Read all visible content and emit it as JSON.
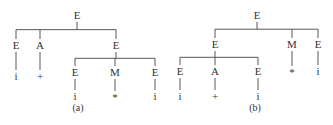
{
  "trees": [
    {
      "caption": "(a)",
      "caption_pos": [
        78,
        111
      ],
      "nodes": [
        {
          "id": "a_root",
          "label": "E",
          "x": 77,
          "y": 19
        },
        {
          "id": "a_E1",
          "label": "E",
          "x": 16,
          "y": 49
        },
        {
          "id": "a_A",
          "label": "A",
          "x": 40,
          "y": 49
        },
        {
          "id": "a_E2",
          "label": "E",
          "x": 116,
          "y": 49
        },
        {
          "id": "a_i1",
          "label": "i",
          "x": 16,
          "y": 80
        },
        {
          "id": "a_plus",
          "label": "+",
          "x": 40,
          "y": 80
        },
        {
          "id": "a_E3",
          "label": "E",
          "x": 75,
          "y": 76
        },
        {
          "id": "a_M",
          "label": "M",
          "x": 115,
          "y": 76
        },
        {
          "id": "a_E4",
          "label": "E",
          "x": 155,
          "y": 76
        },
        {
          "id": "a_i2",
          "label": "i",
          "x": 75,
          "y": 100
        },
        {
          "id": "a_star",
          "label": "*",
          "x": 115,
          "y": 101
        },
        {
          "id": "a_i3",
          "label": "i",
          "x": 155,
          "y": 100
        }
      ],
      "edges": [
        [
          "a_root",
          [
            "a_E1",
            "a_A",
            "a_E2"
          ]
        ],
        [
          "a_E1",
          [
            "a_i1"
          ]
        ],
        [
          "a_A",
          [
            "a_plus"
          ]
        ],
        [
          "a_E2",
          [
            "a_E3",
            "a_M",
            "a_E4"
          ]
        ],
        [
          "a_E3",
          [
            "a_i2"
          ]
        ],
        [
          "a_M",
          [
            "a_star"
          ]
        ],
        [
          "a_E4",
          [
            "a_i3"
          ]
        ]
      ]
    },
    {
      "caption": "(b)",
      "caption_pos": [
        255,
        111
      ],
      "nodes": [
        {
          "id": "b_root",
          "label": "E",
          "x": 257,
          "y": 19
        },
        {
          "id": "b_E1",
          "label": "E",
          "x": 215,
          "y": 48
        },
        {
          "id": "b_M",
          "label": "M",
          "x": 292,
          "y": 48
        },
        {
          "id": "b_E2",
          "label": "E",
          "x": 318,
          "y": 48
        },
        {
          "id": "b_E3",
          "label": "E",
          "x": 180,
          "y": 75
        },
        {
          "id": "b_A",
          "label": "A",
          "x": 215,
          "y": 75
        },
        {
          "id": "b_E4",
          "label": "E",
          "x": 258,
          "y": 75
        },
        {
          "id": "b_star",
          "label": "*",
          "x": 292,
          "y": 76
        },
        {
          "id": "b_i4",
          "label": "i",
          "x": 318,
          "y": 75
        },
        {
          "id": "b_i1",
          "label": "i",
          "x": 180,
          "y": 100
        },
        {
          "id": "b_plus",
          "label": "+",
          "x": 215,
          "y": 100
        },
        {
          "id": "b_i2",
          "label": "i",
          "x": 258,
          "y": 100
        }
      ],
      "edges": [
        [
          "b_root",
          [
            "b_E1",
            "b_M",
            "b_E2"
          ]
        ],
        [
          "b_E1",
          [
            "b_E3",
            "b_A",
            "b_E4"
          ]
        ],
        [
          "b_M",
          [
            "b_star"
          ]
        ],
        [
          "b_E2",
          [
            "b_i4"
          ]
        ],
        [
          "b_E3",
          [
            "b_i1"
          ]
        ],
        [
          "b_A",
          [
            "b_plus"
          ]
        ],
        [
          "b_E4",
          [
            "b_i2"
          ]
        ]
      ]
    }
  ]
}
